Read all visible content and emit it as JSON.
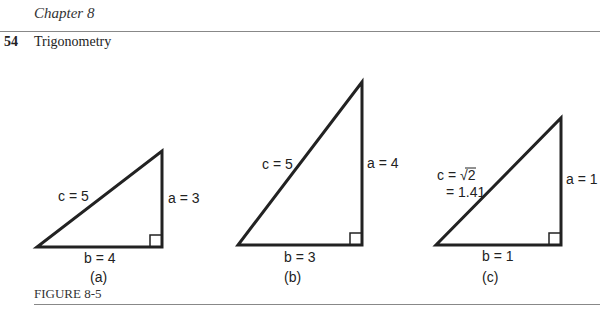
{
  "header": {
    "chapter": "Chapter 8",
    "page_number": "54",
    "section_title": "Trigonometry"
  },
  "figure": {
    "caption": "FIGURE 8-5",
    "panels": [
      {
        "label": "(a)",
        "c": "c = 5",
        "a": "a = 3",
        "b": "b = 4"
      },
      {
        "label": "(b)",
        "c": "c = 5",
        "a": "a = 4",
        "b": "b = 3"
      },
      {
        "label": "(c)",
        "c": "c = √2",
        "c2": "= 1.41",
        "a": "a = 1",
        "b": "b = 1"
      }
    ]
  }
}
